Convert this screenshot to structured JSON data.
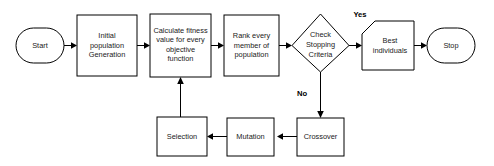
{
  "diagram": {
    "background_color": "#ffffff",
    "stroke_color": "#000000",
    "text_color": "#1a1a1a",
    "nodes": [
      {
        "id": "start",
        "label": "Start",
        "shape": "terminator"
      },
      {
        "id": "init",
        "label": "Initial",
        "label2": "population",
        "label3": "Generation",
        "shape": "process"
      },
      {
        "id": "fitness",
        "label": "Calculate fitness",
        "label2": "value for every",
        "label3": "objective",
        "label4": "function",
        "shape": "process"
      },
      {
        "id": "rank",
        "label": "Rank every",
        "label2": "member of",
        "label3": "population",
        "shape": "process"
      },
      {
        "id": "check",
        "label": "Check",
        "label2": "Stopping",
        "label3": "Criteria",
        "shape": "decision"
      },
      {
        "id": "best",
        "label": "Best",
        "label2": "individuals",
        "shape": "clipped-corner"
      },
      {
        "id": "stop",
        "label": "Stop",
        "shape": "terminator"
      },
      {
        "id": "crossover",
        "label": "Crossover",
        "shape": "process"
      },
      {
        "id": "mutation",
        "label": "Mutation",
        "shape": "process"
      },
      {
        "id": "selection",
        "label": "Selection",
        "shape": "process"
      }
    ],
    "branch_labels": {
      "yes": "Yes",
      "no": "No"
    }
  }
}
